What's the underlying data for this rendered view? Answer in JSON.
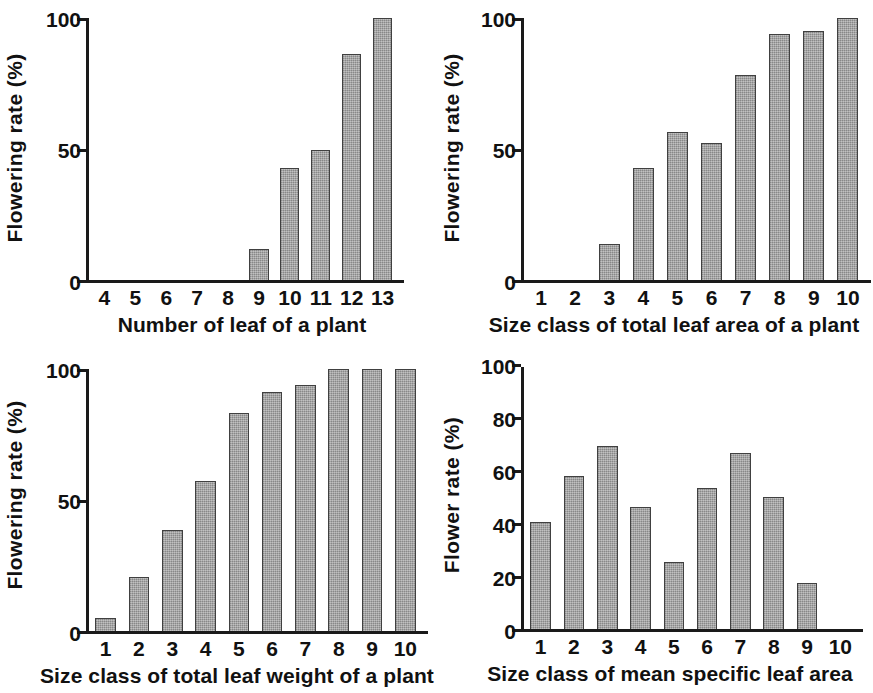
{
  "figure": {
    "background": "#ffffff",
    "bar_color": "#9d9d9d",
    "bar_edge_color": "#404040",
    "axis_color": "#1a1a1a"
  },
  "chart_data": [
    {
      "id": "flowering-rate-vs-leaf-number",
      "type": "bar",
      "position": "top-left",
      "title": "",
      "xlabel": "Number of leaf of a plant",
      "ylabel": "Flowering rate (%)",
      "categories": [
        "4",
        "5",
        "6",
        "7",
        "8",
        "9",
        "10",
        "11",
        "12",
        "13"
      ],
      "values": [
        0,
        0,
        0,
        0,
        0,
        12,
        43,
        50,
        87,
        101
      ],
      "ylim": [
        0,
        101
      ],
      "yticks": [
        0,
        50,
        100
      ],
      "ytick_labels": [
        "0",
        "50",
        "100"
      ],
      "grid": false,
      "legend": "none"
    },
    {
      "id": "flowering-rate-vs-total-leaf-area",
      "type": "bar",
      "position": "top-right",
      "title": "",
      "xlabel": "Size class of total leaf area of a plant",
      "ylabel": "Flowering rate (%)",
      "categories": [
        "1",
        "2",
        "3",
        "4",
        "5",
        "6",
        "7",
        "8",
        "9",
        "10"
      ],
      "values": [
        0,
        0,
        14,
        43,
        57,
        53,
        79,
        95,
        96,
        101
      ],
      "ylim": [
        0,
        101
      ],
      "yticks": [
        0,
        50,
        100
      ],
      "ytick_labels": [
        "0",
        "50",
        "100"
      ],
      "grid": false,
      "legend": "none"
    },
    {
      "id": "flowering-rate-vs-total-leaf-weight",
      "type": "bar",
      "position": "bottom-left",
      "title": "",
      "xlabel": "Size class of total leaf weight of a plant",
      "ylabel": "Flowering rate (%)",
      "categories": [
        "1",
        "2",
        "3",
        "4",
        "5",
        "6",
        "7",
        "8",
        "9",
        "10"
      ],
      "values": [
        5,
        21,
        39,
        58,
        84,
        92,
        95,
        101,
        101,
        101
      ],
      "ylim": [
        0,
        101
      ],
      "yticks": [
        0,
        50,
        100
      ],
      "ytick_labels": [
        "0",
        "50",
        "100"
      ],
      "grid": false,
      "legend": "none"
    },
    {
      "id": "flower-rate-vs-mean-specific-leaf-area",
      "type": "bar",
      "position": "bottom-right",
      "title": "",
      "xlabel": "Size class of mean specific leaf area",
      "ylabel": "Flower rate (%)",
      "categories": [
        "1",
        "2",
        "3",
        "4",
        "5",
        "6",
        "7",
        "8",
        "9",
        "10"
      ],
      "values": [
        41,
        58.5,
        70,
        46.5,
        25.5,
        54,
        67,
        50.5,
        17.5,
        0
      ],
      "ylim": [
        0,
        100
      ],
      "yticks": [
        0,
        20,
        40,
        60,
        80,
        100
      ],
      "ytick_labels": [
        "0",
        "20",
        "40",
        "60",
        "80",
        "100"
      ],
      "grid": false,
      "legend": "none"
    }
  ]
}
